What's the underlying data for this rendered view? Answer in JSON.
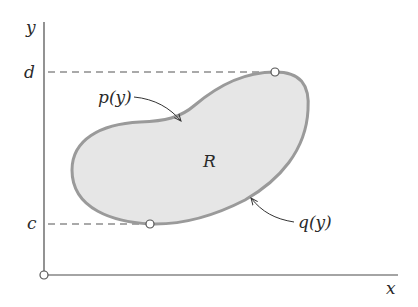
{
  "diagram": {
    "axes": {
      "x_label": "x",
      "y_label": "y",
      "origin_marker": "open-circle"
    },
    "bounds": {
      "upper_label": "d",
      "lower_label": "c"
    },
    "region": {
      "label": "R",
      "fill_color": "#e6e6e6",
      "border_color": "#9a9a9a"
    },
    "curves": {
      "left_boundary_label": "p(y)",
      "right_boundary_label": "q(y)"
    },
    "colors": {
      "axis": "#4a4a4a",
      "dashed": "#555555",
      "text": "#2a2a2a"
    }
  }
}
